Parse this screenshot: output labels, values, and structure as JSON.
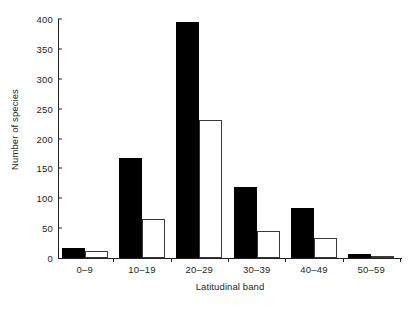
{
  "chart_data": {
    "type": "bar",
    "title": "",
    "subtitle": "",
    "xlabel": "Latitudinal band",
    "ylabel": "Number of species",
    "categories": [
      "0–9",
      "10–19",
      "20–29",
      "30–39",
      "40–49",
      "50–59"
    ],
    "series": [
      {
        "name": "black-bars",
        "color": "#000000",
        "values": [
          17,
          168,
          395,
          119,
          84,
          7
        ]
      },
      {
        "name": "white-bars",
        "color": "#ffffff",
        "values": [
          11,
          65,
          231,
          45,
          34,
          4
        ]
      }
    ],
    "ylim": [
      0,
      400
    ],
    "yticks": [
      0,
      50,
      100,
      150,
      200,
      250,
      300,
      350,
      400
    ],
    "ytick_labels": [
      "0",
      "50",
      "100",
      "150",
      "200",
      "250",
      "300",
      "350",
      "400"
    ],
    "grid": false,
    "legend": "none",
    "axis_color": "#231f20",
    "background": "#ffffff"
  }
}
